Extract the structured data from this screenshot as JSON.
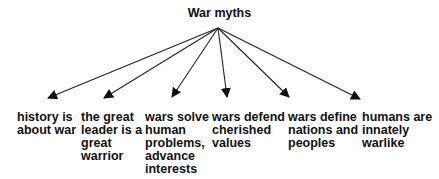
{
  "diagram": {
    "title": "War myths",
    "type": "tree",
    "root": "War myths",
    "nodes": [
      {
        "id": "n1",
        "label": "history is\nabout war"
      },
      {
        "id": "n2",
        "label": "the great\nleader is a\ngreat\nwarrior"
      },
      {
        "id": "n3",
        "label": "wars solve\nhuman\nproblems,\nadvance\ninterests"
      },
      {
        "id": "n4",
        "label": "wars defend\ncherished\nvalues"
      },
      {
        "id": "n5",
        "label": "wars define\nnations and\npeoples"
      },
      {
        "id": "n6",
        "label": "humans are\ninnately\nwarlike"
      }
    ],
    "edges": [
      {
        "from": "War myths",
        "to": "n1"
      },
      {
        "from": "War myths",
        "to": "n2"
      },
      {
        "from": "War myths",
        "to": "n3"
      },
      {
        "from": "War myths",
        "to": "n4"
      },
      {
        "from": "War myths",
        "to": "n5"
      },
      {
        "from": "War myths",
        "to": "n6"
      }
    ]
  }
}
